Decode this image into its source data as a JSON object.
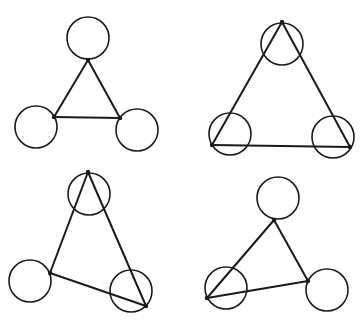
{
  "panels": [
    {
      "id": "top-left",
      "circles": [
        {
          "cx": 88,
          "cy": 38,
          "r": 21
        },
        {
          "cx": 36,
          "cy": 127,
          "r": 21
        },
        {
          "cx": 137,
          "cy": 130,
          "r": 21
        }
      ],
      "triangle": [
        [
          88,
          60
        ],
        [
          54,
          117
        ],
        [
          120,
          118
        ]
      ]
    },
    {
      "id": "top-right",
      "circles": [
        {
          "cx": 282,
          "cy": 44,
          "r": 21
        },
        {
          "cx": 230,
          "cy": 134,
          "r": 21
        },
        {
          "cx": 333,
          "cy": 137,
          "r": 21
        }
      ],
      "triangle": [
        [
          282,
          22
        ],
        [
          212,
          145
        ],
        [
          350,
          147
        ]
      ]
    },
    {
      "id": "bottom-left",
      "circles": [
        {
          "cx": 89,
          "cy": 194,
          "r": 21
        },
        {
          "cx": 30,
          "cy": 281,
          "r": 21
        },
        {
          "cx": 131,
          "cy": 291,
          "r": 21
        }
      ],
      "triangle": [
        [
          88,
          172
        ],
        [
          50,
          273
        ],
        [
          146,
          306
        ]
      ]
    },
    {
      "id": "bottom-right",
      "circles": [
        {
          "cx": 278,
          "cy": 198,
          "r": 21
        },
        {
          "cx": 226,
          "cy": 288,
          "r": 21
        },
        {
          "cx": 327,
          "cy": 290,
          "r": 21
        }
      ],
      "triangle": [
        [
          274,
          220
        ],
        [
          207,
          298
        ],
        [
          308,
          281
        ]
      ]
    }
  ],
  "colors": {
    "stroke": "#1a1a1a",
    "background": "#ffffff"
  }
}
